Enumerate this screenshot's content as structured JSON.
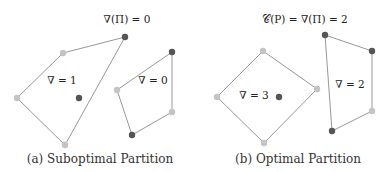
{
  "panels": [
    {
      "caption": "(a) Suboptimal Partition",
      "title": "∇(Π) = 0",
      "polygons": [
        {
          "label": "∇ = 1",
          "vertices": [
            [
              63,
              53,
              "light"
            ],
            [
              125,
              37,
              "dark"
            ],
            [
              65,
              145,
              "light"
            ],
            [
              17,
              98,
              "light"
            ]
          ]
        },
        {
          "label": "∇ = 0",
          "vertices": [
            [
              117,
              90,
              "light"
            ],
            [
              172,
              52,
              "dark"
            ],
            [
              172,
              112,
              "light"
            ],
            [
              132,
              135,
              "dark"
            ]
          ]
        }
      ],
      "points": [
        [
          79,
          98,
          "dark"
        ]
      ]
    },
    {
      "caption": "(b) Optimal Partition",
      "title": "𝒞(P) = ∇(Π) = 2",
      "polygons": [
        {
          "label": "∇ = 3",
          "vertices": [
            [
              263,
              51,
              "light"
            ],
            [
              317,
              89,
              "light"
            ],
            [
              264,
              143,
              "light"
            ],
            [
              217,
              97,
              "light"
            ]
          ]
        },
        {
          "label": "∇ = 2",
          "vertices": [
            [
              325,
              35,
              "dark"
            ],
            [
              372,
              51,
              "dark"
            ],
            [
              372,
              111,
              "light"
            ],
            [
              332,
              131,
              "dark"
            ]
          ]
        }
      ],
      "points": [
        [
          279,
          97,
          "dark"
        ]
      ]
    }
  ],
  "colors": {
    "light": "#c4c4c4",
    "dark": "#555555",
    "edge": "#8c8c8c"
  }
}
